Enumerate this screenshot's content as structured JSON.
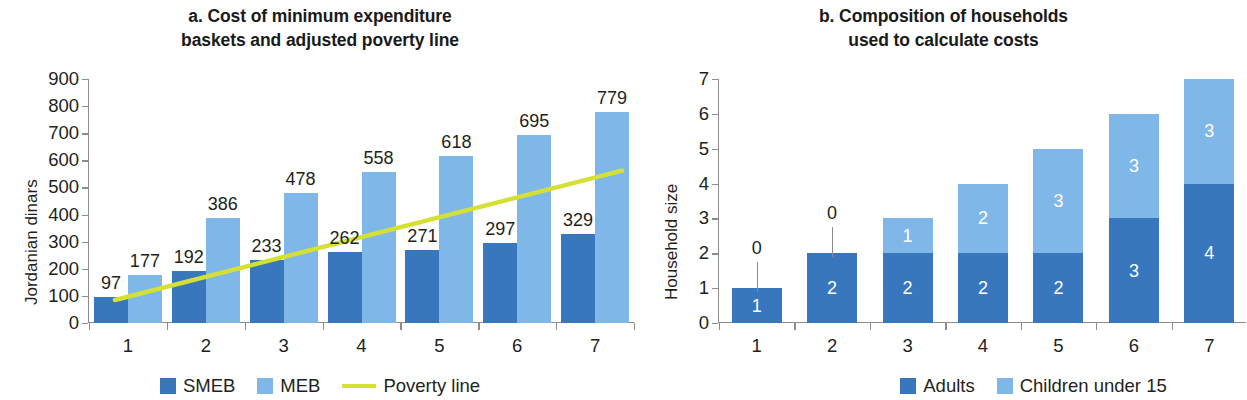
{
  "chart_data": [
    {
      "id": "a",
      "type": "bar",
      "title": "a. Cost of minimum expenditure\nbaskets and adjusted poverty line",
      "title_lines": [
        "a. Cost of minimum expenditure",
        "baskets and adjusted poverty line"
      ],
      "xlabel": "",
      "ylabel": "Jordanian dinars",
      "ylim": [
        0,
        900
      ],
      "yticks": [
        0,
        100,
        200,
        300,
        400,
        500,
        600,
        700,
        800,
        900
      ],
      "ytick_labels": [
        "0",
        "100",
        "200",
        "300",
        "400",
        "500",
        "600",
        "700",
        "800",
        "900"
      ],
      "categories": [
        "1",
        "2",
        "3",
        "4",
        "5",
        "6",
        "7"
      ],
      "grid": false,
      "legend_position": "bottom",
      "series": [
        {
          "name": "SMEB",
          "color": "#3876bd",
          "values": [
            97,
            192,
            233,
            262,
            271,
            297,
            329
          ],
          "value_labels": [
            "97",
            "192",
            "233",
            "262",
            "271",
            "297",
            "329"
          ]
        },
        {
          "name": "MEB",
          "color": "#7fb8e8",
          "values": [
            177,
            386,
            478,
            558,
            618,
            695,
            779
          ],
          "value_labels": [
            "177",
            "386",
            "478",
            "558",
            "618",
            "695",
            "779"
          ]
        }
      ],
      "overlay_line": {
        "name": "Poverty line",
        "color": "#d4e034",
        "start_value": 85,
        "end_value": 562
      },
      "legend": [
        {
          "label": "SMEB",
          "marker": "square",
          "color": "#3876bd"
        },
        {
          "label": "MEB",
          "marker": "square",
          "color": "#7fb8e8"
        },
        {
          "label": "Poverty line",
          "marker": "line",
          "color": "#d4e034"
        }
      ]
    },
    {
      "id": "b",
      "type": "bar",
      "stacked": true,
      "title": "b. Composition of households\nused to calculate costs",
      "title_lines": [
        "b. Composition of households",
        "used to calculate costs"
      ],
      "xlabel": "",
      "ylabel": "Household size",
      "ylim": [
        0,
        7
      ],
      "yticks": [
        0,
        1,
        2,
        3,
        4,
        5,
        6,
        7
      ],
      "ytick_labels": [
        "0",
        "1",
        "2",
        "3",
        "4",
        "5",
        "6",
        "7"
      ],
      "categories": [
        "1",
        "2",
        "3",
        "4",
        "5",
        "6",
        "7"
      ],
      "grid": false,
      "legend_position": "bottom",
      "series": [
        {
          "name": "Adults",
          "color": "#3876bd",
          "values": [
            1,
            2,
            2,
            2,
            2,
            3,
            4
          ],
          "value_labels": [
            "1",
            "2",
            "2",
            "2",
            "2",
            "3",
            "4"
          ]
        },
        {
          "name": "Children under 15",
          "color": "#7fb8e8",
          "values": [
            0,
            0,
            1,
            2,
            3,
            3,
            3
          ],
          "value_labels": [
            "0",
            "0",
            "1",
            "2",
            "3",
            "3",
            "3"
          ]
        }
      ],
      "callout_labels": [
        {
          "category": "1",
          "text": "0"
        },
        {
          "category": "2",
          "text": "0"
        }
      ],
      "legend": [
        {
          "label": "Adults",
          "marker": "square",
          "color": "#3876bd"
        },
        {
          "label": "Children under 15",
          "marker": "square",
          "color": "#7fb8e8"
        }
      ]
    }
  ],
  "colors": {
    "dark_blue": "#3876bd",
    "light_blue": "#7fb8e8",
    "poverty_line": "#d4e034",
    "axis": "#8c8c8c",
    "text": "#231f20",
    "background": "#ffffff"
  }
}
